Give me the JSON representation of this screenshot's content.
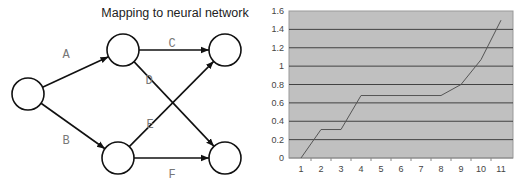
{
  "diagram": {
    "title": "Mapping to neural network",
    "nodes": [
      {
        "id": "input",
        "cx": 28,
        "cy": 94
      },
      {
        "id": "hidden-top",
        "cx": 123,
        "cy": 50
      },
      {
        "id": "hidden-bottom",
        "cx": 118,
        "cy": 158
      },
      {
        "id": "output-top",
        "cx": 225,
        "cy": 50
      },
      {
        "id": "output-bottom",
        "cx": 225,
        "cy": 158
      }
    ],
    "edges": [
      {
        "label": "A",
        "from": "input",
        "to": "hidden-top"
      },
      {
        "label": "B",
        "from": "input",
        "to": "hidden-bottom"
      },
      {
        "label": "C",
        "from": "hidden-top",
        "to": "output-top"
      },
      {
        "label": "D",
        "from": "hidden-top",
        "to": "output-bottom"
      },
      {
        "label": "E",
        "from": "hidden-bottom",
        "to": "output-top"
      },
      {
        "label": "F",
        "from": "hidden-bottom",
        "to": "output-bottom"
      }
    ]
  },
  "chart_data": {
    "type": "line",
    "title": "",
    "xlabel": "",
    "ylabel": "",
    "categories": [
      "1",
      "2",
      "3",
      "4",
      "5",
      "6",
      "7",
      "8",
      "9",
      "10",
      "11"
    ],
    "x": [
      1,
      2,
      3,
      4,
      5,
      6,
      7,
      8,
      9,
      10,
      11
    ],
    "series": [
      {
        "name": "Series 1",
        "values": [
          0,
          0.31,
          0.31,
          0.68,
          0.68,
          0.68,
          0.68,
          0.68,
          0.8,
          1.07,
          1.5
        ]
      }
    ],
    "yticks": [
      "0",
      "0.2",
      "0.4",
      "0.6",
      "0.8",
      "1",
      "1.2",
      "1.4",
      "1.6"
    ],
    "ylim": [
      0,
      1.6
    ],
    "grid": true,
    "legend": "none",
    "colors": {
      "plot_bg": "#c0c0c0",
      "grid": "#333333",
      "line": "#555555"
    }
  }
}
